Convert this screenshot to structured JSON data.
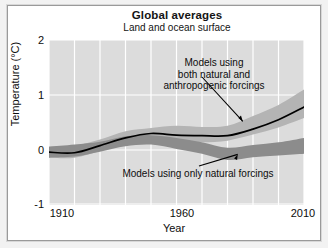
{
  "chart_data": {
    "type": "area",
    "title": "Global averages",
    "subtitle": "Land and ocean surface",
    "xlabel": "Year",
    "ylabel": "Temperature (°C)",
    "xlim": [
      1910,
      2010
    ],
    "ylim": [
      -1,
      2
    ],
    "xticks": [
      "1910",
      "1960",
      "2010"
    ],
    "xtick_values": [
      1910,
      1960,
      2010
    ],
    "yticks": [
      "2",
      "1",
      "0",
      "-1"
    ],
    "ytick_values": [
      2,
      1,
      0,
      -1
    ],
    "grid": true,
    "grid_color": "#ffffff",
    "plot_background": "#dcdcdc",
    "legend_position": "annotations-inline",
    "x": [
      1910,
      1920,
      1930,
      1940,
      1950,
      1960,
      1970,
      1980,
      1990,
      2000,
      2010
    ],
    "series": [
      {
        "name": "Observations",
        "type": "line",
        "color": "#000000",
        "values": [
          -0.04,
          -0.05,
          0.08,
          0.22,
          0.3,
          0.27,
          0.26,
          0.26,
          0.38,
          0.55,
          0.78
        ]
      },
      {
        "name": "Models using both natural and anthropogenic forcings",
        "type": "band",
        "color": "#b4b4b4",
        "lower": [
          -0.14,
          -0.14,
          -0.02,
          0.12,
          0.16,
          0.13,
          0.14,
          0.17,
          0.28,
          0.41,
          0.58
        ],
        "upper": [
          0.06,
          0.08,
          0.19,
          0.34,
          0.4,
          0.44,
          0.42,
          0.44,
          0.62,
          0.82,
          1.1
        ]
      },
      {
        "name": "Models using only natural forcings",
        "type": "band",
        "color": "#8c8c8c",
        "lower": [
          -0.14,
          -0.12,
          -0.03,
          0.07,
          0.1,
          0.02,
          -0.07,
          -0.18,
          -0.13,
          -0.1,
          -0.07
        ],
        "upper": [
          0.06,
          0.1,
          0.15,
          0.25,
          0.27,
          0.22,
          0.14,
          0.04,
          0.09,
          0.14,
          0.22
        ]
      }
    ],
    "annotations": [
      {
        "name": "anthropogenic-forcings-annotation",
        "lines": [
          "Models using",
          "both natural and",
          "anthropogenic forcings"
        ],
        "text": "Models using both natural and anthropogenic forcings",
        "arrow_to": {
          "x": 1986,
          "y": 0.52
        }
      },
      {
        "name": "natural-forcings-annotation",
        "lines": [
          "Models using only natural forcings"
        ],
        "text": "Models using only natural forcings",
        "arrow_to": {
          "x": 1984,
          "y": -0.08
        }
      }
    ]
  }
}
